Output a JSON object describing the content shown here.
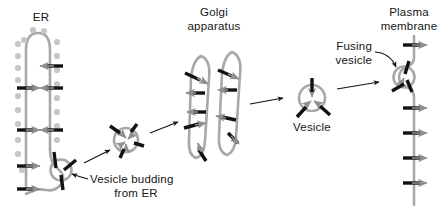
{
  "diagram": {
    "background_color": "#ffffff",
    "membrane_color": "#a8a8a8",
    "ribosome_color": "#c0c0c0",
    "protein_color": "#111111",
    "transport_arrow_color": "#8f8f8f",
    "leader_color": "#101010"
  },
  "labels": {
    "er": "ER",
    "golgi_line1": "Golgi",
    "golgi_line2": "apparatus",
    "vesicle_budding_line1": "Vesicle budding",
    "vesicle_budding_line2": "from ER",
    "vesicle": "Vesicle",
    "fusing_line1": "Fusing",
    "fusing_line2": "vesicle",
    "plasma_line1": "Plasma",
    "plasma_line2": "membrane"
  },
  "stages": [
    {
      "name": "endoplasmic-reticulum",
      "label": "ER",
      "description": "Hairpin-shaped rough ER membrane studded with ribosomes",
      "ribosome_count": 18,
      "membrane_protein_count": 8
    },
    {
      "name": "budding-vesicle",
      "label": "Vesicle budding from ER",
      "description": "Vesicle pinching off the bottom of the ER",
      "membrane_protein_count": 3
    },
    {
      "name": "transport-vesicle",
      "label": "",
      "description": "Free transport vesicle travelling toward the Golgi",
      "membrane_protein_count": 4,
      "interior_arrow_count": 4
    },
    {
      "name": "golgi-apparatus",
      "label": "Golgi apparatus",
      "description": "Two stacked flattened cisternae",
      "cisterna_count": 2,
      "membrane_protein_count": 9
    },
    {
      "name": "secretory-vesicle",
      "label": "Vesicle",
      "description": "Secretory vesicle leaving the Golgi",
      "membrane_protein_count": 3,
      "interior_arrow_count": 3
    },
    {
      "name": "fusing-vesicle",
      "label": "Fusing vesicle",
      "description": "Vesicle fusing with the plasma membrane",
      "membrane_protein_count": 3
    },
    {
      "name": "plasma-membrane",
      "label": "Plasma membrane",
      "description": "Vertical plasma membrane with embedded proteins",
      "membrane_protein_count": 6
    }
  ],
  "flow_arrows": [
    {
      "name": "er-to-vesicle",
      "from": "budding-vesicle",
      "to": "transport-vesicle"
    },
    {
      "name": "vesicle-to-golgi",
      "from": "transport-vesicle",
      "to": "golgi-apparatus"
    },
    {
      "name": "golgi-to-vesicle",
      "from": "golgi-apparatus",
      "to": "secretory-vesicle"
    },
    {
      "name": "vesicle-to-membrane",
      "from": "secretory-vesicle",
      "to": "plasma-membrane"
    }
  ]
}
